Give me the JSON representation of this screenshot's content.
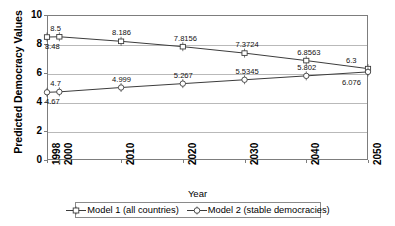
{
  "chart_data": {
    "type": "line",
    "title": "",
    "xlabel": "Year",
    "ylabel": "Predicted Democracy Values",
    "x": [
      1998,
      2000,
      2010,
      2020,
      2030,
      2040,
      2050
    ],
    "xticklabels": [
      "1998",
      "2000",
      "2010",
      "2020",
      "2030",
      "2040",
      "2050"
    ],
    "yticklabels": [
      "0",
      "2",
      "4",
      "6",
      "8",
      "10"
    ],
    "yticks": [
      0,
      2,
      4,
      6,
      8,
      10
    ],
    "ylim": [
      0,
      10
    ],
    "xlim": [
      1998,
      2050
    ],
    "grid": true,
    "legend_position": "bottom",
    "series": [
      {
        "name": "Model 1 (all countries)",
        "marker": "square",
        "values": [
          8.48,
          8.5,
          8.186,
          7.8156,
          7.3724,
          6.8563,
          6.3
        ],
        "labels": [
          "8.48",
          "8.5",
          "8.186",
          "7.8156",
          "7.3724",
          "6.8563",
          "6.3"
        ]
      },
      {
        "name": "Model 2 (stable democracies)",
        "marker": "circle",
        "values": [
          4.67,
          4.7,
          4.999,
          5.267,
          5.5345,
          5.802,
          6.076
        ],
        "labels": [
          "4.67",
          "4.7",
          "4.999",
          "5.267",
          "5.5345",
          "5.802",
          "6.076"
        ]
      }
    ],
    "annotations": [
      {
        "text": "8.5",
        "series": 0,
        "x": 2000,
        "value": 8.5,
        "pos": "above"
      },
      {
        "text": "8.48",
        "series": 0,
        "x": 1998,
        "value": 8.48,
        "pos": "below"
      },
      {
        "text": "8.186",
        "series": 0,
        "x": 2010,
        "value": 8.186,
        "pos": "above"
      },
      {
        "text": "7.8156",
        "series": 0,
        "x": 2020,
        "value": 7.8156,
        "pos": "above"
      },
      {
        "text": "7.3724",
        "series": 0,
        "x": 2030,
        "value": 7.3724,
        "pos": "above"
      },
      {
        "text": "6.8563",
        "series": 0,
        "x": 2040,
        "value": 6.8563,
        "pos": "above"
      },
      {
        "text": "6.3",
        "series": 0,
        "x": 2050,
        "value": 6.3,
        "pos": "above-left"
      },
      {
        "text": "4.7",
        "series": 1,
        "x": 2000,
        "value": 4.7,
        "pos": "above"
      },
      {
        "text": "4.67",
        "series": 1,
        "x": 1998,
        "value": 4.67,
        "pos": "below"
      },
      {
        "text": "4.999",
        "series": 1,
        "x": 2010,
        "value": 4.999,
        "pos": "above"
      },
      {
        "text": "5.267",
        "series": 1,
        "x": 2020,
        "value": 5.267,
        "pos": "above"
      },
      {
        "text": "5.5345",
        "series": 1,
        "x": 2030,
        "value": 5.5345,
        "pos": "above"
      },
      {
        "text": "5.802",
        "series": 1,
        "x": 2040,
        "value": 5.802,
        "pos": "above"
      },
      {
        "text": "6.076",
        "series": 1,
        "x": 2050,
        "value": 6.076,
        "pos": "below-left"
      }
    ],
    "colors": {
      "line": "#3c3c3c",
      "grid": "#b9b9b9",
      "frame": "#7d7d7d",
      "text": "#000000"
    }
  },
  "legend": {
    "entries": [
      {
        "label": "Model 1 (all countries)"
      },
      {
        "label": "Model 2 (stable democracies)"
      }
    ]
  },
  "axes": {
    "y_title": "Predicted Democracy Values",
    "x_title": "Year"
  }
}
